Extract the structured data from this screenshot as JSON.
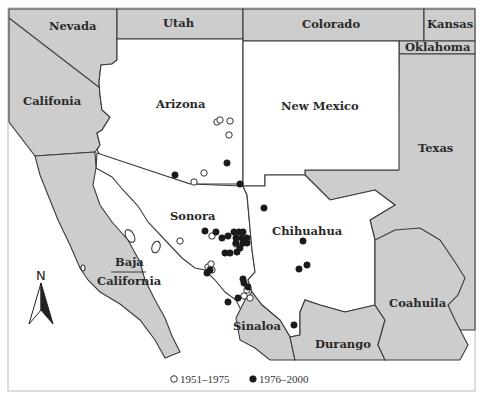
{
  "map": {
    "regions": {
      "nevada": "Nevada",
      "utah": "Utah",
      "colorado": "Colorado",
      "kansas": "Kansas",
      "oklahoma": "Oklahoma",
      "california": "Califonia",
      "arizona": "Arizona",
      "new_mexico": "New Mexico",
      "texas": "Texas",
      "sonora": "Sonora",
      "chihuahua": "Chihuahua",
      "baja_line1": "Baja",
      "baja_line2": "California",
      "coahuila": "Coahuila",
      "sinaloa": "Sinaloa",
      "durango": "Durango"
    },
    "north_arrow": {
      "label": "N"
    },
    "legend": [
      {
        "symbol": "open-circle",
        "label": "1951–1975"
      },
      {
        "symbol": "filled-circle",
        "label": "1976–2000"
      }
    ],
    "colors": {
      "highlighted_states": "#ffffff",
      "other_states": "#cdcdcd",
      "border": "#3a3a3a",
      "point_filled": "#1a1a1a"
    },
    "points_1951_1975": [
      [
        217,
        122
      ],
      [
        220,
        120
      ],
      [
        230,
        121
      ],
      [
        229,
        135
      ],
      [
        204,
        173
      ],
      [
        194,
        182
      ],
      [
        180,
        241
      ],
      [
        212,
        236
      ],
      [
        236,
        244
      ],
      [
        208,
        267
      ],
      [
        211,
        264
      ],
      [
        212,
        270
      ],
      [
        247,
        290
      ],
      [
        244,
        296
      ],
      [
        250,
        298
      ]
    ],
    "points_1976_2000": [
      [
        227,
        163
      ],
      [
        175,
        175
      ],
      [
        240,
        184
      ],
      [
        205,
        231
      ],
      [
        216,
        232
      ],
      [
        222,
        238
      ],
      [
        228,
        236
      ],
      [
        234,
        232
      ],
      [
        239,
        232
      ],
      [
        243,
        232
      ],
      [
        236,
        238
      ],
      [
        242,
        238
      ],
      [
        247,
        238
      ],
      [
        236,
        243
      ],
      [
        243,
        243
      ],
      [
        247,
        243
      ],
      [
        240,
        248
      ],
      [
        225,
        253
      ],
      [
        230,
        253
      ],
      [
        237,
        252
      ],
      [
        207,
        273
      ],
      [
        210,
        270
      ],
      [
        243,
        279
      ],
      [
        244,
        283
      ],
      [
        248,
        287
      ],
      [
        238,
        298
      ],
      [
        228,
        302
      ],
      [
        264,
        208
      ],
      [
        303,
        241
      ],
      [
        299,
        269
      ],
      [
        307,
        265
      ],
      [
        294,
        325
      ]
    ]
  }
}
